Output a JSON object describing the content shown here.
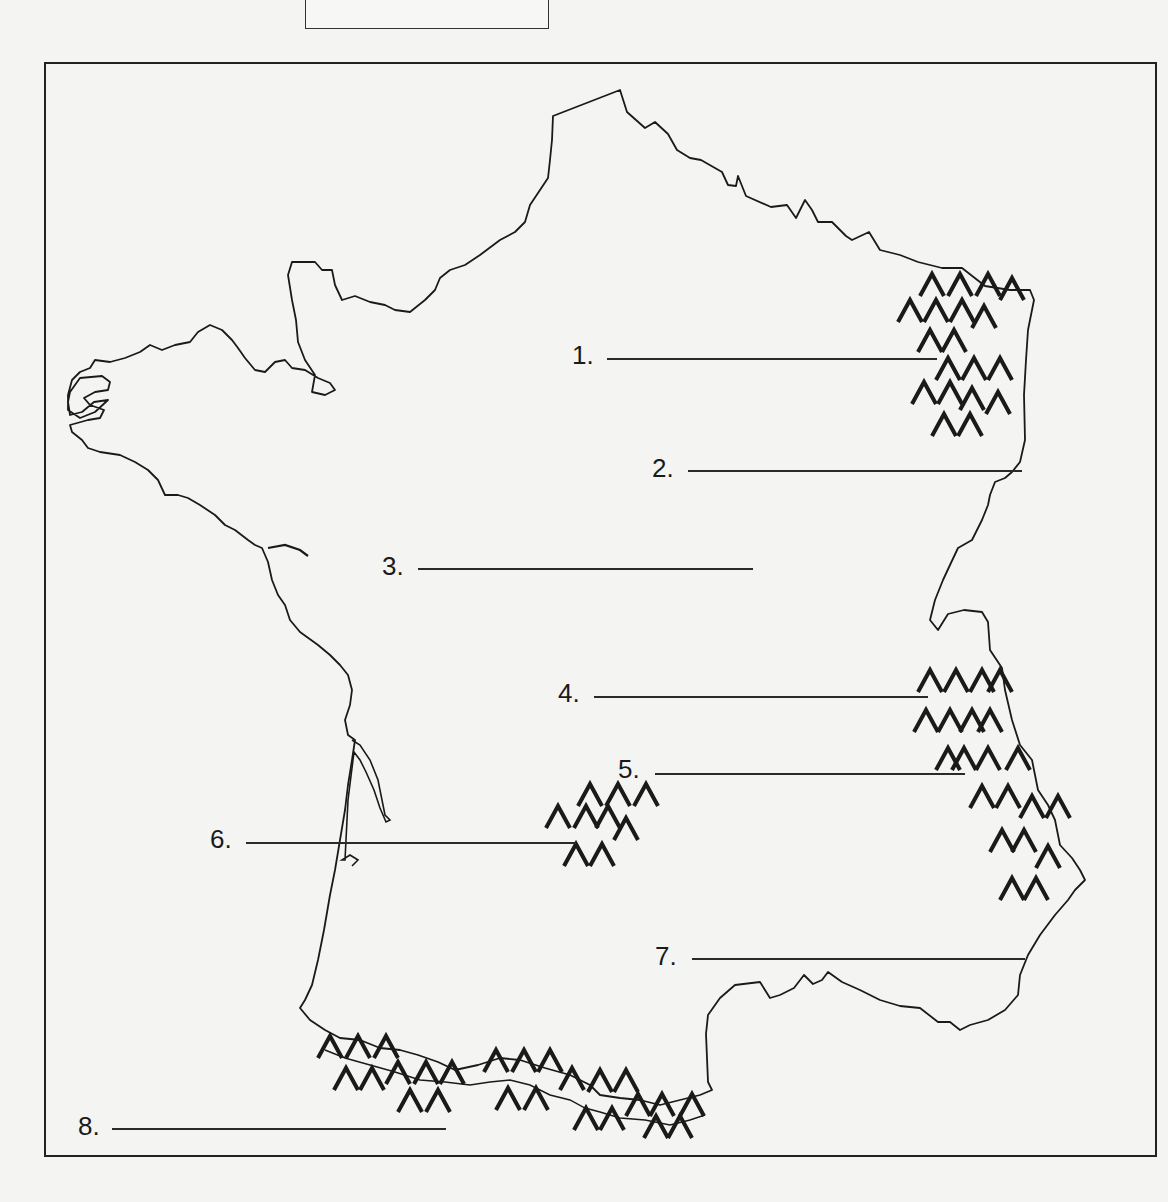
{
  "worksheet": {
    "title_box": "",
    "map_subject": "France outline map with mountain ranges",
    "colors": {
      "ink": "#1a1a1a",
      "paper": "#f4f4f2"
    }
  },
  "labels": [
    {
      "number": "1.",
      "answer": ""
    },
    {
      "number": "2.",
      "answer": ""
    },
    {
      "number": "3.",
      "answer": ""
    },
    {
      "number": "4.",
      "answer": ""
    },
    {
      "number": "5.",
      "answer": ""
    },
    {
      "number": "6.",
      "answer": ""
    },
    {
      "number": "7.",
      "answer": ""
    },
    {
      "number": "8.",
      "answer": ""
    }
  ],
  "legend_symbols": {
    "mountain": "mountain-chevron-icon"
  }
}
